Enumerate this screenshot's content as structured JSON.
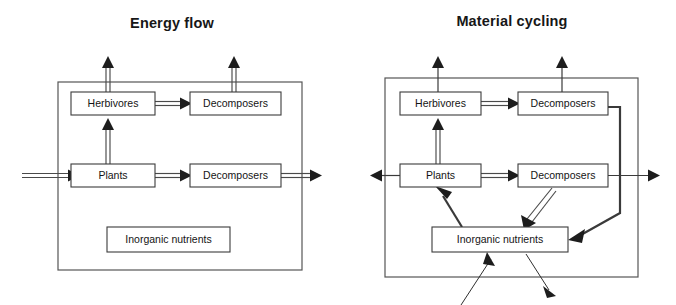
{
  "page": {
    "background_color": "#ffffff",
    "line_color": "#3a3a3a",
    "box_fill": "#ffffff",
    "text_color": "#141414"
  },
  "panels": [
    {
      "id": "energy-flow",
      "title": "Energy flow",
      "boxes": [
        {
          "id": "herbivores",
          "label": "Herbivores"
        },
        {
          "id": "decomposers-top",
          "label": "Decomposers"
        },
        {
          "id": "plants",
          "label": "Plants"
        },
        {
          "id": "decomposers-bottom",
          "label": "Decomposers"
        },
        {
          "id": "inorganic-nutrients",
          "label": "Inorganic nutrients"
        }
      ],
      "flows": [
        {
          "from": "external-left",
          "to": "plants",
          "style": "double-arrow",
          "direction": "right"
        },
        {
          "from": "plants",
          "to": "herbivores",
          "style": "double-arrow",
          "direction": "up"
        },
        {
          "from": "plants",
          "to": "decomposers-bottom",
          "style": "double-arrow",
          "direction": "right"
        },
        {
          "from": "herbivores",
          "to": "decomposers-top",
          "style": "double-arrow",
          "direction": "right"
        },
        {
          "from": "herbivores",
          "to": "external-top",
          "style": "double-arrow",
          "direction": "up"
        },
        {
          "from": "decomposers-top",
          "to": "external-top",
          "style": "double-arrow",
          "direction": "up"
        },
        {
          "from": "decomposers-bottom",
          "to": "external-right",
          "style": "double-arrow",
          "direction": "right"
        }
      ]
    },
    {
      "id": "material-cycling",
      "title": "Material cycling",
      "boxes": [
        {
          "id": "herbivores",
          "label": "Herbivores"
        },
        {
          "id": "decomposers-top",
          "label": "Decomposers"
        },
        {
          "id": "plants",
          "label": "Plants"
        },
        {
          "id": "decomposers-bottom",
          "label": "Decomposers"
        },
        {
          "id": "inorganic-nutrients",
          "label": "Inorganic nutrients"
        }
      ],
      "flows": [
        {
          "from": "plants",
          "to": "external-left",
          "style": "single-arrow",
          "direction": "left"
        },
        {
          "from": "plants",
          "to": "herbivores",
          "style": "double-arrow",
          "direction": "up"
        },
        {
          "from": "plants",
          "to": "decomposers-bottom",
          "style": "double-arrow",
          "direction": "right"
        },
        {
          "from": "herbivores",
          "to": "decomposers-top",
          "style": "double-arrow",
          "direction": "right"
        },
        {
          "from": "herbivores",
          "to": "external-top",
          "style": "single-arrow",
          "direction": "up"
        },
        {
          "from": "decomposers-top",
          "to": "external-top",
          "style": "single-arrow",
          "direction": "up"
        },
        {
          "from": "decomposers-bottom",
          "to": "external-right",
          "style": "single-arrow",
          "direction": "right"
        },
        {
          "from": "decomposers-top",
          "to": "inorganic-nutrients",
          "style": "thick-elbow",
          "direction": "down-left"
        },
        {
          "from": "decomposers-bottom",
          "to": "inorganic-nutrients",
          "style": "double-arrow",
          "direction": "down-left"
        },
        {
          "from": "inorganic-nutrients",
          "to": "plants",
          "style": "thick-arrow",
          "direction": "up-left"
        },
        {
          "from": "external-below",
          "to": "inorganic-nutrients",
          "style": "thin-arrow",
          "direction": "up-right"
        },
        {
          "from": "inorganic-nutrients",
          "to": "external-below",
          "style": "thin-arrow",
          "direction": "down-right"
        }
      ]
    }
  ]
}
